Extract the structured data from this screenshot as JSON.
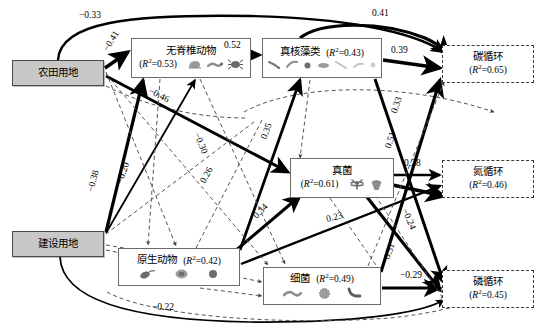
{
  "figure": {
    "type": "structural-equation-model-path-diagram",
    "colors": {
      "driver_fill": "#c8c8c8",
      "node_stroke": "#6b6b6b",
      "positive_path": "#000000",
      "negative_path": "#000000",
      "dashed_path": "#555555"
    }
  },
  "nodes": [
    {
      "id": "cropland",
      "label": "农田用地",
      "r2": null,
      "type": "driver",
      "x": 12,
      "y": 60,
      "w": 92,
      "h": 26
    },
    {
      "id": "builtup",
      "label": "建设用地",
      "r2": null,
      "type": "driver",
      "x": 12,
      "y": 231,
      "w": 92,
      "h": 26
    },
    {
      "id": "invertebrates",
      "label": "无脊椎动物",
      "r2": "0.53",
      "type": "biota",
      "x": 131,
      "y": 38,
      "w": 120,
      "h": 40
    },
    {
      "id": "algae",
      "label": "真核藻类",
      "r2": "0.43",
      "type": "biota",
      "x": 262,
      "y": 38,
      "w": 120,
      "h": 40
    },
    {
      "id": "fungi",
      "label": "真菌",
      "r2": "0.61",
      "type": "biota",
      "x": 290,
      "y": 158,
      "w": 104,
      "h": 40
    },
    {
      "id": "protozoa",
      "label": "原生动物",
      "r2": "0.42",
      "type": "biota",
      "x": 118,
      "y": 248,
      "w": 122,
      "h": 38
    },
    {
      "id": "bacteria",
      "label": "细菌",
      "r2": "0.49",
      "type": "biota",
      "x": 263,
      "y": 267,
      "w": 118,
      "h": 38
    },
    {
      "id": "carbon",
      "label": "碳循环",
      "r2": "0.65",
      "type": "cycle",
      "x": 442,
      "y": 45,
      "w": 92,
      "h": 38
    },
    {
      "id": "nitrogen",
      "label": "氮循环",
      "r2": "0.46",
      "type": "cycle",
      "x": 442,
      "y": 160,
      "w": 92,
      "h": 38
    },
    {
      "id": "phosphorus",
      "label": "磷循环",
      "r2": "0.45",
      "type": "cycle",
      "x": 442,
      "y": 270,
      "w": 92,
      "h": 38
    }
  ],
  "r2_prefix": "(",
  "r2_suffix": ")",
  "r2_symbol": "R",
  "r2_exponent": "2",
  "r2_equals": "=",
  "edges": [
    {
      "id": "e1",
      "from": "cropland",
      "to": "carbon",
      "coef": "−0.33",
      "sign": "negative",
      "style": "solid",
      "weight": 2.4,
      "label_x": 79,
      "label_y": 10,
      "rot": 0
    },
    {
      "id": "e2",
      "from": "algae",
      "to": "carbon",
      "coef": "0.41",
      "sign": "positive",
      "style": "solid",
      "weight": 3.2,
      "label_x": 372,
      "label_y": 8,
      "rot": 0
    },
    {
      "id": "e3",
      "from": "cropland",
      "to": "invertebrates",
      "coef": "−0.41",
      "sign": "negative",
      "style": "solid",
      "weight": 3.4,
      "label_x": 106,
      "label_y": 38,
      "rot": -58
    },
    {
      "id": "e4",
      "from": "invertebrates",
      "to": "algae",
      "coef": "0.52",
      "sign": "positive",
      "style": "solid",
      "weight": 3.6,
      "label_x": 224,
      "label_y": 40,
      "rot": 0
    },
    {
      "id": "e5",
      "from": "algae",
      "to": "carbon",
      "coef": "0.39",
      "sign": "positive",
      "style": "solid",
      "weight": 3.4,
      "label_x": 391,
      "label_y": 45,
      "rot": 0
    },
    {
      "id": "e6",
      "from": "cropland",
      "to": "fungi",
      "coef": "−0.46",
      "sign": "negative",
      "style": "solid",
      "weight": 3.0,
      "label_x": 155,
      "label_y": 93,
      "rot": 26
    },
    {
      "id": "e7",
      "from": "bacteria",
      "to": "carbon",
      "coef": "0.33",
      "sign": "positive",
      "style": "solid",
      "weight": 3.2,
      "label_x": 392,
      "label_y": 100,
      "rot": 62
    },
    {
      "id": "e8",
      "from": "protozoa",
      "to": "algae",
      "coef": "0.35",
      "sign": "positive",
      "style": "solid",
      "weight": 2.8,
      "label_x": 262,
      "label_y": 128,
      "rot": -66
    },
    {
      "id": "e9",
      "from": "cropland",
      "to": "protozoa",
      "coef": "−0.30",
      "sign": "negative",
      "style": "dashed",
      "weight": 1.0,
      "label_x": 196,
      "label_y": 140,
      "rot": 66
    },
    {
      "id": "e10",
      "from": "fungi",
      "to": "carbon",
      "coef": "0.51",
      "sign": "positive",
      "style": "dashed",
      "weight": 1.0,
      "label_x": 386,
      "label_y": 137,
      "rot": 68
    },
    {
      "id": "e11",
      "from": "builtup",
      "to": "invertebrates",
      "coef": "−0.38",
      "sign": "negative",
      "style": "solid",
      "weight": 3.2,
      "label_x": 89,
      "label_y": 178,
      "rot": -72
    },
    {
      "id": "e12",
      "from": "builtup",
      "to": "algae",
      "coef": "−0.20",
      "sign": "negative",
      "style": "solid",
      "weight": 1.6,
      "label_x": 119,
      "label_y": 170,
      "rot": -70
    },
    {
      "id": "e13",
      "from": "builtup",
      "to": "fungi",
      "coef": "0.26",
      "sign": "positive",
      "style": "dashed",
      "weight": 1.0,
      "label_x": 203,
      "label_y": 172,
      "rot": -66
    },
    {
      "id": "e14",
      "from": "fungi",
      "to": "nitrogen",
      "coef": "0.28",
      "sign": "positive",
      "style": "solid",
      "weight": 2.4,
      "label_x": 404,
      "label_y": 160,
      "rot": 0
    },
    {
      "id": "e15",
      "from": "protozoa",
      "to": "fungi",
      "coef": "0.34",
      "sign": "positive",
      "style": "solid",
      "weight": 3.0,
      "label_x": 257,
      "label_y": 208,
      "rot": -48
    },
    {
      "id": "e16",
      "from": "protozoa",
      "to": "nitrogen",
      "coef": "0.23",
      "sign": "positive",
      "style": "solid",
      "weight": 2.2,
      "label_x": 330,
      "label_y": 214,
      "rot": -13
    },
    {
      "id": "e17",
      "from": "algae",
      "to": "phosphorus",
      "coef": "−0.24",
      "sign": "negative",
      "style": "solid",
      "weight": 3.0,
      "label_x": 404,
      "label_y": 216,
      "rot": 62
    },
    {
      "id": "e18",
      "from": "bacteria",
      "to": "nitrogen",
      "coef": "0.31",
      "sign": "positive",
      "style": "dashed",
      "weight": 1.0,
      "label_x": 385,
      "label_y": 248,
      "rot": 66
    },
    {
      "id": "e19",
      "from": "bacteria",
      "to": "phosphorus",
      "coef": "−0.29",
      "sign": "negative",
      "style": "solid",
      "weight": 3.0,
      "label_x": 402,
      "label_y": 272,
      "rot": 0
    },
    {
      "id": "e20",
      "from": "builtup",
      "to": "phosphorus",
      "coef": "−0.22",
      "sign": "negative",
      "style": "solid",
      "weight": 1.6,
      "label_x": 157,
      "label_y": 305,
      "rot": 0
    }
  ],
  "glyph_sets": {
    "invertebrates": [
      "snail",
      "worm",
      "mite"
    ],
    "algae": [
      "diatom-a",
      "diatom-b",
      "green-alga",
      "alga-cluster",
      "diatom-c",
      "diatom-d",
      "alga-dot"
    ],
    "fungi": [
      "mycelium",
      "mushroom"
    ],
    "protozoa": [
      "flagellate",
      "amoeba",
      "ciliate"
    ],
    "bacteria": [
      "bacillus",
      "coccus-colony",
      "vibrio"
    ]
  }
}
